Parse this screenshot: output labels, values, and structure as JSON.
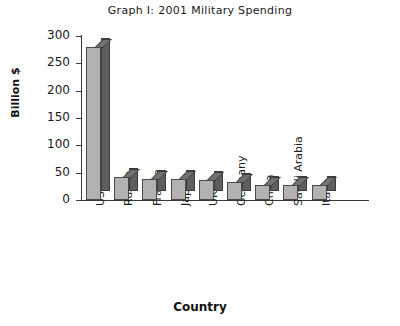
{
  "chart_data": {
    "type": "bar",
    "title": "Graph I: 2001 Military Spending",
    "xlabel": "Country",
    "ylabel": "Billion $",
    "categories": [
      "USA",
      "Russia",
      "France",
      "Japan",
      "UK",
      "Germany",
      "China",
      "Saudi Arabia",
      "Italy"
    ],
    "values": [
      280,
      42,
      38,
      38,
      37,
      33,
      27,
      27,
      27
    ],
    "yticks": [
      0,
      50,
      100,
      150,
      200,
      250,
      300
    ],
    "ylim": [
      0,
      300
    ],
    "grid": false,
    "legend": false,
    "style": "3d-extruded-bars",
    "colors": {
      "bar_front": "#b2b2b2",
      "bar_side": "#5e5e5e",
      "bar_top": "#717171",
      "axis": "#3a3a3a",
      "text": "#1a1a1a",
      "background": "#ffffff"
    }
  }
}
